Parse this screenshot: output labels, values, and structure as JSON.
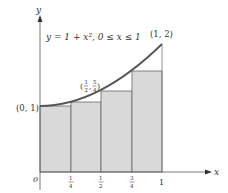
{
  "diagram": {
    "title": "y = 1 + x², 0 ≤ x ≤ 1",
    "function": "y=1+x^2",
    "domain": "0≤x≤1",
    "axes": {
      "x_label": "x",
      "y_label": "y",
      "origin_label": "0",
      "x_ticks": [
        {
          "value": 0,
          "label": "0"
        },
        {
          "value": 0.25,
          "num": "1",
          "den": "4"
        },
        {
          "value": 0.5,
          "num": "1",
          "den": "2"
        },
        {
          "value": 0.75,
          "num": "3",
          "den": "4"
        },
        {
          "value": 1,
          "label": "1"
        }
      ]
    },
    "points": [
      {
        "label": "(0, 1)",
        "x": 0,
        "y": 1
      },
      {
        "label": "(1/2, 5/4)",
        "x": 0.5,
        "y": 1.25,
        "x_num": "1",
        "x_den": "2",
        "y_num": "5",
        "y_den": "4"
      },
      {
        "label": "(1, 2)",
        "x": 1,
        "y": 2
      }
    ],
    "rectangles": [
      {
        "x_left": 0,
        "x_right": 0.25,
        "height": 1
      },
      {
        "x_left": 0.25,
        "x_right": 0.5,
        "height": 1.0625
      },
      {
        "x_left": 0.5,
        "x_right": 0.75,
        "height": 1.25
      },
      {
        "x_left": 0.75,
        "x_right": 1,
        "height": 1.5625
      }
    ],
    "colors": {
      "curve": "#555555",
      "rect_fill": "#d9d9d9",
      "rect_stroke": "#666666",
      "axis": "#555555"
    }
  }
}
